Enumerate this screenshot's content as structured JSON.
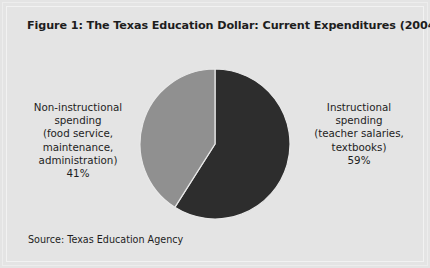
{
  "figure": {
    "title": "Figure 1: The Texas Education Dollar: Current Expenditures (2004-2005)",
    "source": "Source: Texas Education Agency",
    "background_color": "#e4e4e4",
    "frame_color": "#f2f2f2",
    "text_color": "#1d1d1d"
  },
  "labels": {
    "left": {
      "lines": [
        "Non-instructional",
        "spending",
        "(food service,",
        "maintenance,",
        "administration)",
        "41%"
      ]
    },
    "right": {
      "lines": [
        "Instructional",
        "spending",
        "(teacher salaries,",
        "textbooks)",
        "59%"
      ]
    }
  },
  "chart_data": {
    "type": "pie",
    "title": "Figure 1: The Texas Education Dollar: Current Expenditures (2004-2005)",
    "xlabel": "",
    "ylabel": "",
    "legend_position": "outside-labels",
    "grid": false,
    "start_angle_deg": 0,
    "direction": "clockwise",
    "units": "percent",
    "center": {
      "x": 215,
      "y": 144
    },
    "radius": 76,
    "slices": [
      {
        "name": "Instructional spending (teacher salaries, textbooks)",
        "short_name": "Instructional spending",
        "value": 59,
        "label": "59%",
        "color": "#2d2d2d",
        "start_deg": 0,
        "end_deg": 212.4
      },
      {
        "name": "Non-instructional spending (food service, maintenance, administration)",
        "short_name": "Non-instructional spending",
        "value": 41,
        "label": "41%",
        "color": "#909090",
        "start_deg": 212.4,
        "end_deg": 360
      }
    ],
    "total": 100,
    "source": "Source: Texas Education Agency"
  }
}
